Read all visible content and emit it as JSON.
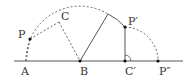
{
  "diagram": {
    "type": "geometry-rotation",
    "colors": {
      "line": "#555555",
      "dashed": "#555555",
      "point": "#111111",
      "text": "#333333"
    },
    "points": {
      "A": {
        "label": "A",
        "x": 26,
        "y": 61
      },
      "B": {
        "label": "B",
        "x": 80,
        "y": 61
      },
      "P": {
        "label": "P",
        "x": 30,
        "y": 39
      },
      "C": {
        "label": "C",
        "x": 59,
        "y": 22
      },
      "Pp": {
        "label": "P′",
        "x": 125,
        "y": 27
      },
      "Cp": {
        "label": "C′",
        "x": 125,
        "y": 61
      },
      "Ppp": {
        "label": "P″",
        "x": 158,
        "y": 61
      }
    },
    "elements": [
      "baseline through A, B, C′, P″",
      "dashed arc centered at B from A through top to P′",
      "dashed arc centered at C′ from P′ to P″",
      "dashed segments A–P, P–C, C–B",
      "solid segment B to arc top, solid arc to P′",
      "solid segment P′–C′ with right-angle arc mark at C′"
    ]
  }
}
